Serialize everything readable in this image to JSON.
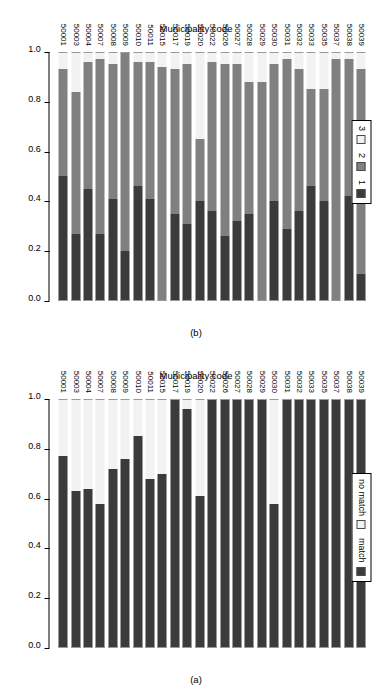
{
  "figure": {
    "orientation": "rotated-90",
    "panels": [
      "b",
      "a"
    ]
  },
  "panel_a": {
    "tag": "(a)",
    "category_axis_title": "Municipality code",
    "legend": {
      "items": [
        {
          "label": "match",
          "key": "dark-square",
          "color": "#3b3b3b"
        },
        {
          "label": "no match",
          "key": "white-square",
          "color": "#f2f2f2"
        }
      ]
    },
    "ticks": [
      "0.0",
      "0.2",
      "0.4",
      "0.6",
      "0.8",
      "1.0"
    ]
  },
  "panel_b": {
    "tag": "(b)",
    "category_axis_title": "Municipality code",
    "legend": {
      "items": [
        {
          "label": "1",
          "key": "dark-square",
          "color": "#3b3b3b"
        },
        {
          "label": "2",
          "key": "mid-square",
          "color": "#808080"
        },
        {
          "label": "3",
          "key": "light-square",
          "color": "#f2f2f2"
        }
      ]
    },
    "ticks": [
      "0.0",
      "0.2",
      "0.4",
      "0.6",
      "0.8",
      "1.0"
    ]
  },
  "chart_data": [
    {
      "id": "panel_a",
      "type": "bar",
      "title": "(a)",
      "stacked": true,
      "orientation": "horizontal",
      "xlabel": "",
      "ylabel": "Municipality code",
      "xlim": [
        0.0,
        1.0
      ],
      "ticks": [
        0.0,
        0.2,
        0.4,
        0.6,
        0.8,
        1.0
      ],
      "grid": false,
      "legend_position": "top-left",
      "categories": [
        "50001",
        "50003",
        "50004",
        "50007",
        "50008",
        "50009",
        "50010",
        "50011",
        "50015",
        "50017",
        "50019",
        "50020",
        "50022",
        "50026",
        "50027",
        "50028",
        "50029",
        "50030",
        "50031",
        "50032",
        "50033",
        "50035",
        "50037",
        "50038",
        "50039"
      ],
      "series": [
        {
          "name": "match",
          "color": "#3b3b3b",
          "values": [
            0.77,
            0.63,
            0.64,
            0.58,
            0.72,
            0.76,
            0.85,
            0.68,
            0.7,
            1.0,
            0.96,
            0.61,
            1.0,
            1.0,
            1.0,
            1.0,
            1.0,
            0.58,
            1.0,
            1.0,
            1.0,
            1.0,
            1.0,
            1.0,
            1.0
          ]
        },
        {
          "name": "no match",
          "color": "#f2f2f2",
          "values": [
            0.23,
            0.37,
            0.36,
            0.42,
            0.28,
            0.24,
            0.15,
            0.32,
            0.3,
            0.0,
            0.04,
            0.39,
            0.0,
            0.0,
            0.0,
            0.0,
            0.0,
            0.42,
            0.0,
            0.0,
            0.0,
            0.0,
            0.0,
            0.0,
            0.0
          ]
        }
      ]
    },
    {
      "id": "panel_b",
      "type": "bar",
      "title": "(b)",
      "stacked": true,
      "orientation": "horizontal",
      "xlabel": "",
      "ylabel": "Municipality code",
      "xlim": [
        0.0,
        1.0
      ],
      "ticks": [
        0.0,
        0.2,
        0.4,
        0.6,
        0.8,
        1.0
      ],
      "grid": false,
      "legend_position": "top-left",
      "categories": [
        "50001",
        "50003",
        "50004",
        "50007",
        "50008",
        "50009",
        "50010",
        "50011",
        "50015",
        "50017",
        "50019",
        "50020",
        "50022",
        "50026",
        "50027",
        "50028",
        "50029",
        "50030",
        "50031",
        "50032",
        "50033",
        "50035",
        "50037",
        "50038",
        "50039"
      ],
      "series": [
        {
          "name": "1",
          "color": "#3b3b3b",
          "values": [
            0.5,
            0.27,
            0.45,
            0.27,
            0.41,
            0.2,
            0.46,
            0.41,
            0.0,
            0.35,
            0.31,
            0.4,
            0.36,
            0.26,
            0.32,
            0.35,
            0.0,
            0.4,
            0.29,
            0.36,
            0.46,
            0.4,
            0.0,
            0.42,
            0.11
          ]
        },
        {
          "name": "2",
          "color": "#808080",
          "values": [
            0.43,
            0.57,
            0.51,
            0.7,
            0.54,
            0.8,
            0.5,
            0.55,
            0.94,
            0.58,
            0.64,
            0.25,
            0.6,
            0.69,
            0.63,
            0.53,
            0.88,
            0.55,
            0.68,
            0.57,
            0.39,
            0.45,
            0.97,
            0.55,
            0.82
          ]
        },
        {
          "name": "3",
          "color": "#f2f2f2",
          "values": [
            0.07,
            0.16,
            0.04,
            0.03,
            0.05,
            0.0,
            0.04,
            0.04,
            0.06,
            0.07,
            0.05,
            0.35,
            0.04,
            0.05,
            0.05,
            0.12,
            0.12,
            0.05,
            0.03,
            0.07,
            0.15,
            0.15,
            0.03,
            0.03,
            0.07
          ]
        }
      ]
    }
  ]
}
